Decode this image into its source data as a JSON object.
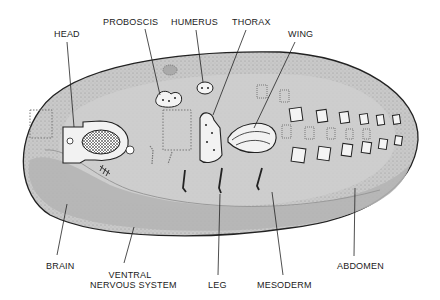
{
  "figure": {
    "colors": {
      "embryo_fill": "#c8c8c8",
      "outline": "#222222",
      "disc_fill": "#f4f4f4",
      "background": "#ffffff"
    }
  },
  "labels": {
    "head": "HEAD",
    "proboscis": "PROBOSCIS",
    "humerus": "HUMERUS",
    "thorax": "THORAX",
    "wing": "WING",
    "brain": "BRAIN",
    "ventral_line1": "VENTRAL",
    "ventral_line2": "NERVOUS SYSTEM",
    "leg": "LEG",
    "mesoderm": "MESODERM",
    "abdomen": "ABDOMEN"
  }
}
